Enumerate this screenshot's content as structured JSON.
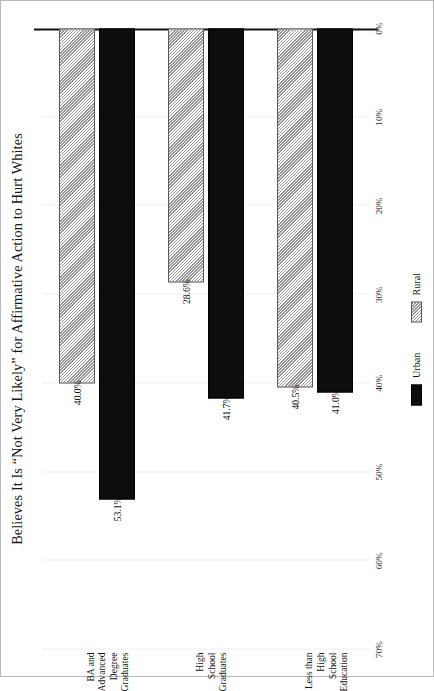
{
  "chart_data": {
    "type": "bar",
    "title": "Believes It Is “Not Very Likely” for Affirmative Action to Hurt Whites",
    "orientation": "horizontal-rotated",
    "categories": [
      "Less than High\nSchool Education",
      "High School\nGraduates",
      "BA and Advanced\nDegree Graduates"
    ],
    "series": [
      {
        "name": "Urban",
        "color": "#0d0d0d",
        "fill": "solid-black",
        "values": [
          41.0,
          41.7,
          53.1
        ],
        "labels": [
          "41.0%",
          "41.7%",
          "53.1%"
        ]
      },
      {
        "name": "Rural",
        "color": "#e9e9e9",
        "fill": "diagonal-hatch",
        "values": [
          40.5,
          28.6,
          40.0
        ],
        "labels": [
          "40.5%",
          "28.6%",
          "40.0%"
        ]
      }
    ],
    "xlabel": "",
    "ylabel": "",
    "ylim": [
      0,
      70
    ],
    "tick_values": [
      0,
      10,
      20,
      30,
      40,
      50,
      60,
      70
    ],
    "tick_labels": [
      "0%",
      "10%",
      "20%",
      "30%",
      "40%",
      "50%",
      "60%",
      "70%"
    ],
    "grid": true,
    "legend_position": "bottom"
  }
}
